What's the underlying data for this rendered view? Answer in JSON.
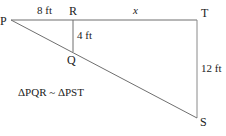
{
  "diagram": {
    "points": {
      "P": {
        "label": "P",
        "x": 11,
        "y": 20
      },
      "R": {
        "label": "R",
        "x": 73,
        "y": 20
      },
      "T": {
        "label": "T",
        "x": 197,
        "y": 20
      },
      "Q": {
        "label": "Q",
        "x": 73,
        "y": 52
      },
      "S": {
        "label": "S",
        "x": 197,
        "y": 118
      }
    },
    "measures": {
      "PR": "8 ft",
      "RT": "x",
      "RQ": "4 ft",
      "TS": "12 ft"
    },
    "statement": "ΔPQR ~ ΔPST",
    "line_color": "#7a7a7a"
  }
}
